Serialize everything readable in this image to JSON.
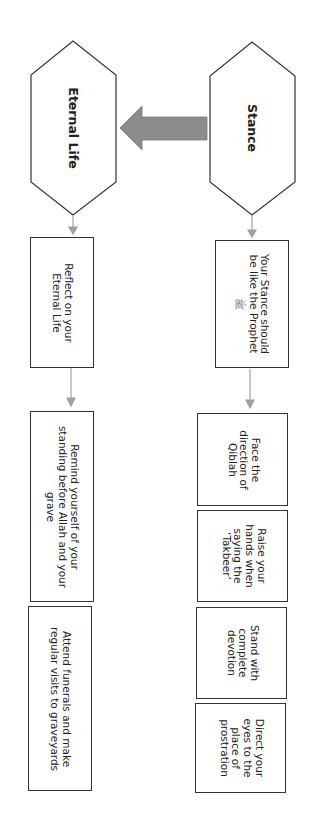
{
  "diagram": {
    "hexagons": [
      {
        "id": "stance",
        "label": "Stance"
      },
      {
        "id": "eternal_life",
        "label": "Eternal Life"
      }
    ],
    "connector_arrow": {
      "from": "Stance",
      "to": "Eternal Life",
      "color": "#8c8c8c"
    },
    "stance_column": {
      "header_box": {
        "lines": [
          "Your Stance should",
          "be like the Prophet"
        ],
        "honorific": "ﷺ"
      },
      "steps": [
        {
          "lines": [
            "Face the",
            "direction of",
            "Qiblah"
          ]
        },
        {
          "lines": [
            "Raise your",
            "hands when",
            "saying the",
            "‘Takbeer’"
          ]
        },
        {
          "lines": [
            "Stand with",
            "complete",
            "devotion"
          ]
        },
        {
          "lines": [
            "Direct your",
            "eyes to the",
            "place of",
            "prostration"
          ]
        }
      ]
    },
    "eternal_column": {
      "header_box": {
        "lines": [
          "Reflect on your",
          "Eternal Life"
        ]
      },
      "steps": [
        {
          "lines": [
            "Remind yourself of your",
            "standing before Allah and your",
            "grave"
          ]
        },
        {
          "lines": [
            "Attend funerals and make",
            "regular visits to graveyards"
          ]
        }
      ]
    },
    "colors": {
      "border": "#333333",
      "connector": "#a0a0a0",
      "big_arrow": "#8c8c8c"
    }
  }
}
